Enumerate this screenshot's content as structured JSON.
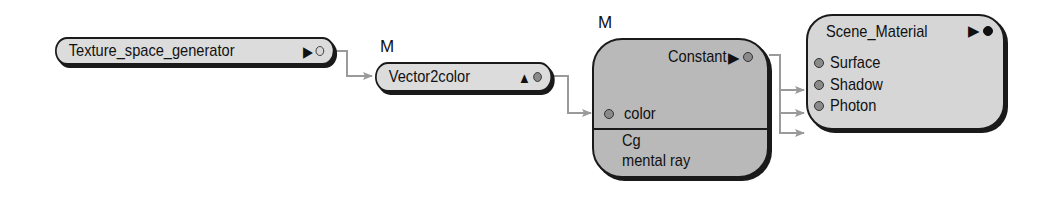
{
  "colors": {
    "wire": "#9a9a9a",
    "node_light": "#dcdcdc",
    "node_dark": "#b9b9b9",
    "outline": "#1a1a1a"
  },
  "nodes": {
    "texture_space_generator": {
      "label": "Texture_space_generator",
      "output_glyph": "▶",
      "output_port": "hollow"
    },
    "vector2color": {
      "badge": "M",
      "label": "Vector2color",
      "output_glyph": "▲",
      "output_port": "filled-gray"
    },
    "constant": {
      "badge": "M",
      "label": "Constant",
      "output_glyph": "▶",
      "inputs": [
        {
          "label": "color"
        }
      ],
      "footer": [
        "Cg",
        "mental ray"
      ]
    },
    "scene_material": {
      "label": "Scene_Material",
      "output_glyph": "▶",
      "output_port": "solid",
      "inputs": [
        {
          "label": "Surface"
        },
        {
          "label": "Shadow"
        },
        {
          "label": "Photon"
        }
      ]
    }
  },
  "connections": [
    {
      "from": "Texture_space_generator",
      "to": "Vector2color"
    },
    {
      "from": "Vector2color",
      "to": "Constant.color"
    },
    {
      "from": "Constant",
      "to": "Scene_Material.Surface"
    },
    {
      "from": "Constant",
      "to": "Scene_Material.Shadow"
    },
    {
      "from": "Constant",
      "to": "Scene_Material.Photon"
    }
  ]
}
